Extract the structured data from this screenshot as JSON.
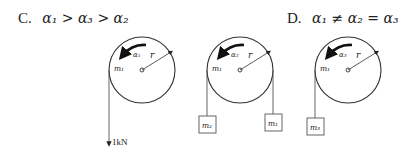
{
  "options": [
    {
      "letter": "C.",
      "expression": "α₁ > α₃ > α₂"
    },
    {
      "letter": "D.",
      "expression": "α₁ ≠ α₂ = α₃"
    }
  ],
  "pulleys": [
    {
      "id": "pulley-1",
      "alpha_label": "α₁",
      "mass_label": "m₁",
      "radius_label": "r",
      "hanging": [
        {
          "side": "left",
          "type": "force",
          "label": "1kN"
        }
      ]
    },
    {
      "id": "pulley-2",
      "alpha_label": "α₂",
      "mass_label": "m₁",
      "radius_label": "r",
      "hanging": [
        {
          "side": "left",
          "type": "block",
          "label": "m₂"
        },
        {
          "side": "right",
          "type": "block",
          "label": "m₁"
        }
      ]
    },
    {
      "id": "pulley-3",
      "alpha_label": "α₃",
      "mass_label": "m₁",
      "radius_label": "r",
      "hanging": [
        {
          "side": "left",
          "type": "block",
          "label": "m₃"
        }
      ]
    }
  ]
}
